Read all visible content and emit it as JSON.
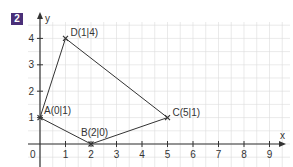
{
  "exercise": {
    "number": "2",
    "badge_color": "#4a2f78"
  },
  "diagram": {
    "type": "coordinate-system",
    "x_axis": {
      "label": "x",
      "ticks": [
        "1",
        "2",
        "3",
        "4",
        "5",
        "6",
        "7",
        "8",
        "9"
      ],
      "origin_label": "0"
    },
    "y_axis": {
      "label": "y",
      "ticks": [
        "1",
        "2",
        "3",
        "4"
      ]
    },
    "points": [
      {
        "name": "A",
        "label": "A(0|1)",
        "x": 0,
        "y": 1
      },
      {
        "name": "B",
        "label": "B(2|0)",
        "x": 2,
        "y": 0
      },
      {
        "name": "C",
        "label": "C(5|1)",
        "x": 5,
        "y": 1
      },
      {
        "name": "D",
        "label": "D(1|4)",
        "x": 1,
        "y": 4
      }
    ],
    "polygon": [
      "A",
      "B",
      "C",
      "D"
    ],
    "colors": {
      "grid": "#dcdcdc",
      "axis": "#333333",
      "line": "#333333"
    }
  }
}
